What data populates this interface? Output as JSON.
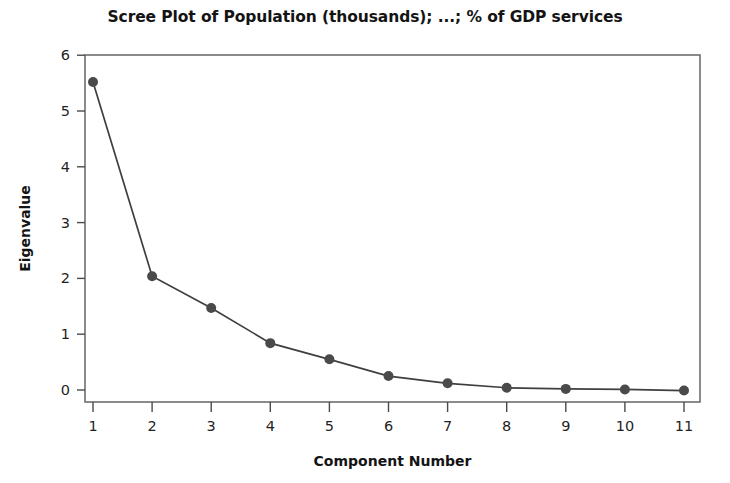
{
  "chart_data": {
    "type": "line",
    "title": "Scree Plot of Population (thousands); ...; % of GDP services",
    "xlabel": "Component Number",
    "ylabel": "Eigenvalue",
    "x": [
      1,
      2,
      3,
      4,
      5,
      6,
      7,
      8,
      9,
      10,
      11
    ],
    "values": [
      5.52,
      2.04,
      1.47,
      0.84,
      0.55,
      0.25,
      0.12,
      0.04,
      0.02,
      0.01,
      -0.01
    ],
    "categories": [
      "1",
      "2",
      "3",
      "4",
      "5",
      "6",
      "7",
      "8",
      "9",
      "10",
      "11"
    ],
    "xtick_labels": [
      "1",
      "2",
      "3",
      "4",
      "5",
      "6",
      "7",
      "8",
      "9",
      "10",
      "11"
    ],
    "ytick_labels": [
      "0",
      "1",
      "2",
      "3",
      "4",
      "5",
      "6"
    ],
    "yticks": [
      0,
      1,
      2,
      3,
      4,
      5,
      6
    ],
    "xlim": [
      0.6,
      11.4
    ],
    "ylim": [
      -0.35,
      6.0
    ],
    "grid": false,
    "legend": false,
    "marker": "circle",
    "marker_color": "#4a4a4a",
    "line_color": "#3f3f3f",
    "frame_color": "#6e6e6e",
    "background_color": "#ffffff"
  }
}
